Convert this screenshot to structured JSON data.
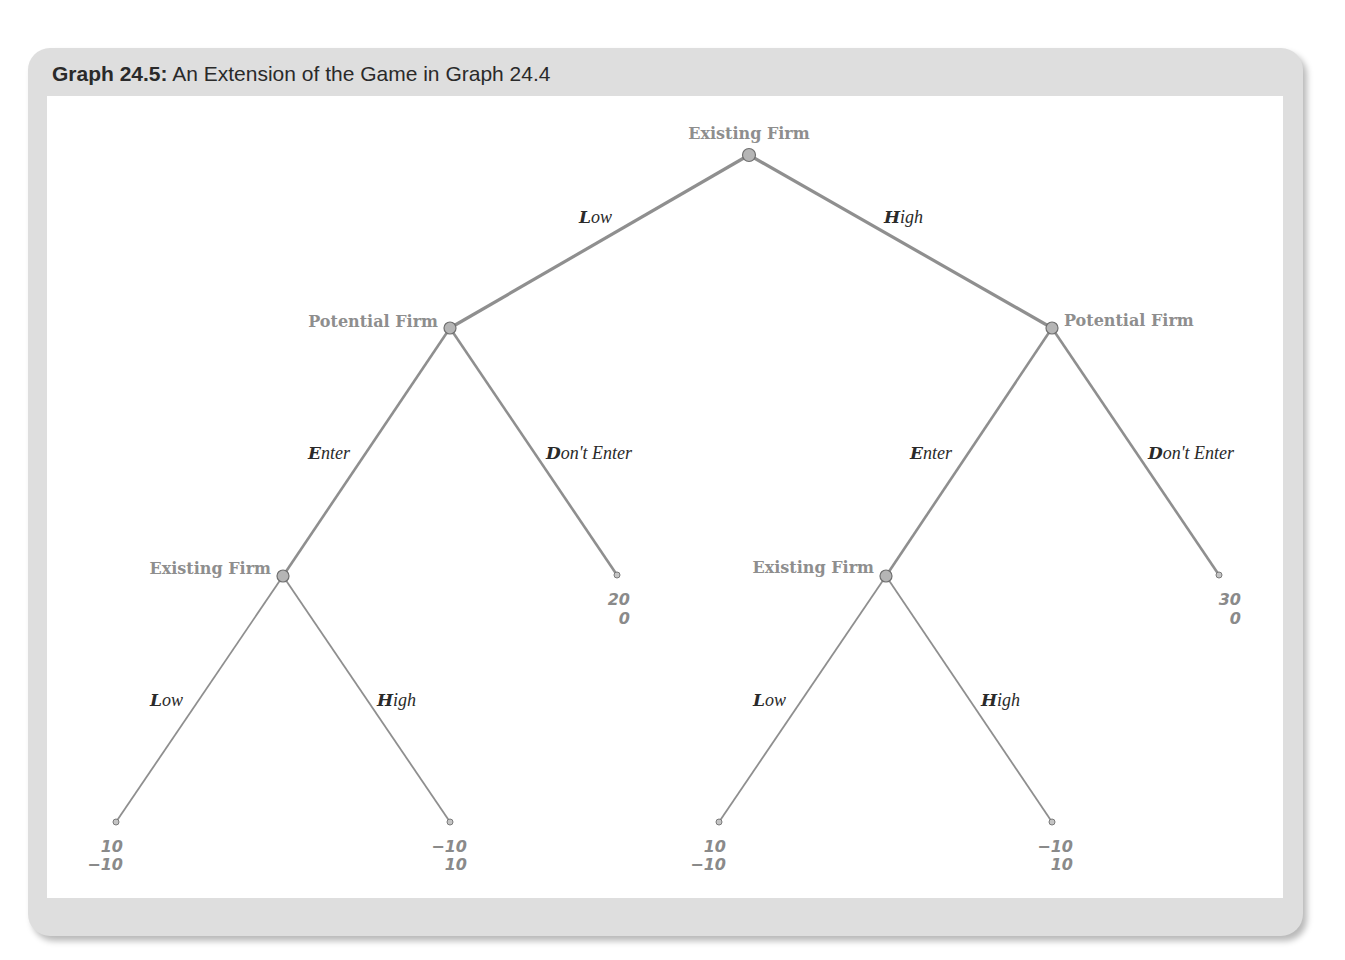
{
  "figure": {
    "title_bold": "Graph 24.5:",
    "title_rest": " An Extension of the Game in Graph 24.4"
  },
  "colors": {
    "header_bg": "#dedede",
    "panel_bg": "#ffffff",
    "edge": "#8f8f8f",
    "node_fill": "#b5b5b5",
    "node_label": "#8e8e8e",
    "payoff": "#8a8a8a",
    "edge_label": "#2a2a2a"
  },
  "tree": {
    "root": {
      "label": "Existing Firm"
    },
    "root_edges": {
      "left": {
        "cap": "L",
        "rest": "ow"
      },
      "right": {
        "cap": "H",
        "rest": "igh"
      }
    },
    "left_branch": {
      "node_label": "Potential Firm",
      "enter": {
        "cap": "E",
        "rest": "nter"
      },
      "dont_enter": {
        "cap": "D",
        "rest": "on't Enter"
      },
      "dont_enter_payoff": {
        "existing": "20",
        "potential": "0"
      },
      "sub_node_label": "Existing Firm",
      "low": {
        "cap": "L",
        "rest": "ow"
      },
      "high": {
        "cap": "H",
        "rest": "igh"
      },
      "low_payoff": {
        "existing": "10",
        "potential": "−10"
      },
      "high_payoff": {
        "existing": "−10",
        "potential": "10"
      }
    },
    "right_branch": {
      "node_label": "Potential Firm",
      "enter": {
        "cap": "E",
        "rest": "nter"
      },
      "dont_enter": {
        "cap": "D",
        "rest": "on't Enter"
      },
      "dont_enter_payoff": {
        "existing": "30",
        "potential": "0"
      },
      "sub_node_label": "Existing Firm",
      "low": {
        "cap": "L",
        "rest": "ow"
      },
      "high": {
        "cap": "H",
        "rest": "igh"
      },
      "low_payoff": {
        "existing": "10",
        "potential": "−10"
      },
      "high_payoff": {
        "existing": "−10",
        "potential": "10"
      }
    }
  }
}
